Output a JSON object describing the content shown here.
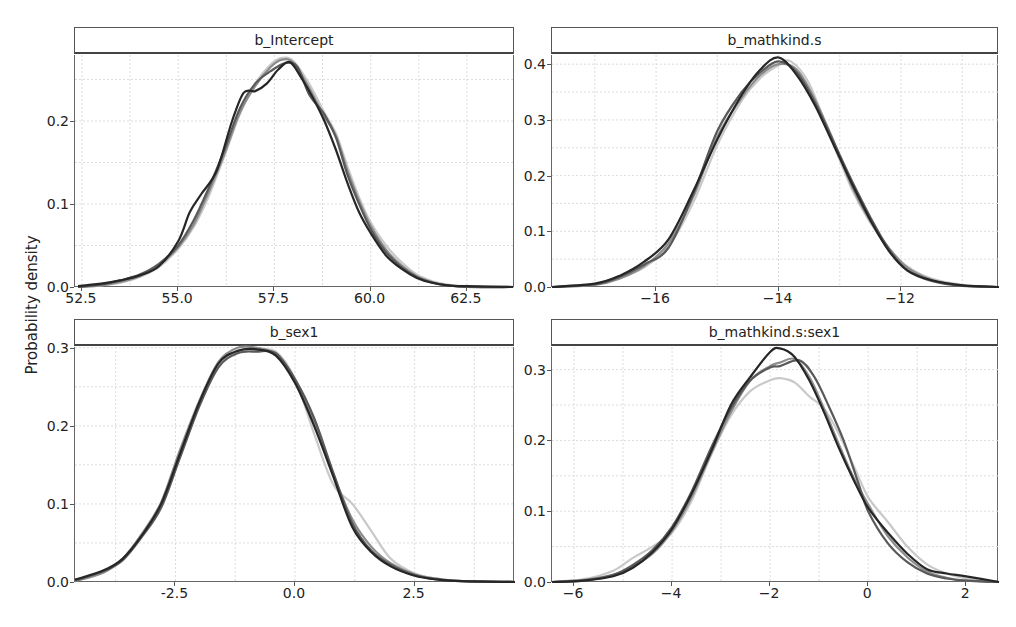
{
  "chart_data": {
    "type": "line",
    "title": "",
    "ylabel": "Probability density",
    "chain_colors": [
      "#262626",
      "#595959",
      "#8c8c8c",
      "#c9c9c9"
    ],
    "panels": [
      {
        "title": "b_Intercept",
        "box": {
          "left": 74,
          "top": 27,
          "width": 440,
          "height": 260
        },
        "xlim": [
          52.32,
          63.75
        ],
        "ylim": [
          0,
          0.2795
        ],
        "xticks": [
          52.5,
          55.0,
          57.5,
          60.0,
          62.5
        ],
        "xtick_labels": [
          "52.5",
          "55.0",
          "57.5",
          "60.0",
          "62.5"
        ],
        "yticks": [
          0.0,
          0.1,
          0.2
        ],
        "ytick_labels": [
          "0.0",
          "0.1",
          "0.2"
        ],
        "series": [
          {
            "name": "chain 1",
            "x": [
              52.4,
              53.0,
              53.5,
              54.0,
              54.5,
              55.0,
              55.3,
              55.6,
              56.0,
              56.4,
              56.7,
              57.0,
              57.3,
              57.6,
              57.9,
              58.2,
              58.5,
              58.8,
              59.1,
              59.4,
              59.7,
              60.0,
              60.4,
              60.8,
              61.2,
              61.6,
              62.0,
              62.5,
              63.7
            ],
            "y": [
              0.001,
              0.004,
              0.008,
              0.014,
              0.025,
              0.055,
              0.09,
              0.112,
              0.14,
              0.2,
              0.234,
              0.236,
              0.245,
              0.262,
              0.271,
              0.252,
              0.228,
              0.2,
              0.165,
              0.125,
              0.09,
              0.065,
              0.038,
              0.022,
              0.011,
              0.005,
              0.002,
              0.001,
              0.0
            ]
          },
          {
            "name": "chain 2",
            "x": [
              52.4,
              53.0,
              53.5,
              54.0,
              54.5,
              55.0,
              55.4,
              55.8,
              56.2,
              56.6,
              57.0,
              57.4,
              57.8,
              58.1,
              58.4,
              58.8,
              59.1,
              59.4,
              59.7,
              60.0,
              60.4,
              60.8,
              61.2,
              61.6,
              62.0,
              62.5,
              63.7
            ],
            "y": [
              0.0,
              0.003,
              0.008,
              0.015,
              0.028,
              0.05,
              0.08,
              0.12,
              0.165,
              0.215,
              0.245,
              0.26,
              0.27,
              0.265,
              0.232,
              0.208,
              0.18,
              0.135,
              0.1,
              0.07,
              0.042,
              0.024,
              0.012,
              0.005,
              0.002,
              0.0,
              0.0
            ]
          },
          {
            "name": "chain 3",
            "x": [
              52.4,
              53.0,
              53.5,
              54.0,
              54.5,
              55.0,
              55.4,
              55.8,
              56.2,
              56.6,
              57.0,
              57.4,
              57.7,
              58.0,
              58.4,
              58.8,
              59.1,
              59.4,
              59.7,
              60.0,
              60.4,
              60.8,
              61.2,
              61.6,
              62.0,
              62.5,
              63.7
            ],
            "y": [
              0.0,
              0.002,
              0.006,
              0.013,
              0.026,
              0.048,
              0.075,
              0.115,
              0.16,
              0.21,
              0.242,
              0.265,
              0.274,
              0.27,
              0.24,
              0.205,
              0.182,
              0.14,
              0.104,
              0.074,
              0.045,
              0.026,
              0.013,
              0.006,
              0.002,
              0.0,
              0.0
            ]
          },
          {
            "name": "chain 4",
            "x": [
              52.4,
              53.0,
              53.5,
              54.0,
              54.5,
              55.0,
              55.4,
              55.8,
              56.2,
              56.6,
              57.0,
              57.4,
              57.7,
              58.0,
              58.4,
              58.8,
              59.1,
              59.4,
              59.7,
              60.0,
              60.4,
              60.8,
              61.2,
              61.6,
              62.0,
              62.5,
              63.7
            ],
            "y": [
              0.0,
              0.002,
              0.005,
              0.012,
              0.024,
              0.046,
              0.072,
              0.11,
              0.158,
              0.208,
              0.245,
              0.268,
              0.276,
              0.272,
              0.245,
              0.21,
              0.185,
              0.145,
              0.108,
              0.078,
              0.05,
              0.03,
              0.015,
              0.007,
              0.003,
              0.001,
              0.0
            ]
          }
        ]
      },
      {
        "title": "b_mathkind.s",
        "box": {
          "left": 551,
          "top": 27,
          "width": 447,
          "height": 260
        },
        "xlim": [
          -17.7,
          -10.4
        ],
        "ylim": [
          0,
          0.4165
        ],
        "xticks": [
          -16,
          -14,
          -12
        ],
        "xtick_labels": [
          "−16",
          "−14",
          "−12"
        ],
        "yticks": [
          0.0,
          0.1,
          0.2,
          0.3,
          0.4
        ],
        "ytick_labels": [
          "0.0",
          "0.1",
          "0.2",
          "0.3",
          "0.4"
        ],
        "series": [
          {
            "name": "chain 1",
            "x": [
              -17.7,
              -17.0,
              -16.6,
              -16.2,
              -15.8,
              -15.4,
              -15.0,
              -14.6,
              -14.3,
              -14.0,
              -13.7,
              -13.4,
              -13.1,
              -12.8,
              -12.5,
              -12.2,
              -11.9,
              -11.5,
              -11.0,
              -10.4
            ],
            "y": [
              0.0,
              0.006,
              0.02,
              0.045,
              0.085,
              0.17,
              0.265,
              0.345,
              0.39,
              0.412,
              0.38,
              0.325,
              0.255,
              0.185,
              0.12,
              0.065,
              0.03,
              0.012,
              0.003,
              0.0
            ]
          },
          {
            "name": "chain 2",
            "x": [
              -17.7,
              -17.0,
              -16.6,
              -16.2,
              -15.8,
              -15.4,
              -15.0,
              -14.6,
              -14.3,
              -14.0,
              -13.7,
              -13.4,
              -13.1,
              -12.8,
              -12.5,
              -12.2,
              -11.9,
              -11.5,
              -11.0,
              -10.4
            ],
            "y": [
              0.0,
              0.005,
              0.018,
              0.04,
              0.07,
              0.165,
              0.28,
              0.35,
              0.385,
              0.405,
              0.385,
              0.33,
              0.26,
              0.19,
              0.125,
              0.068,
              0.03,
              0.011,
              0.002,
              0.0
            ]
          },
          {
            "name": "chain 3",
            "x": [
              -17.7,
              -17.0,
              -16.6,
              -16.2,
              -15.8,
              -15.4,
              -15.0,
              -14.6,
              -14.3,
              -14.0,
              -13.7,
              -13.4,
              -13.1,
              -12.8,
              -12.5,
              -12.2,
              -11.9,
              -11.5,
              -11.0,
              -10.4
            ],
            "y": [
              0.0,
              0.004,
              0.015,
              0.037,
              0.078,
              0.16,
              0.27,
              0.34,
              0.38,
              0.4,
              0.39,
              0.335,
              0.262,
              0.18,
              0.118,
              0.07,
              0.035,
              0.013,
              0.003,
              0.0
            ]
          },
          {
            "name": "chain 4",
            "x": [
              -17.7,
              -17.0,
              -16.6,
              -16.2,
              -15.8,
              -15.4,
              -15.0,
              -14.6,
              -14.3,
              -14.0,
              -13.8,
              -13.5,
              -13.1,
              -12.8,
              -12.5,
              -12.2,
              -11.9,
              -11.5,
              -11.0,
              -10.4
            ],
            "y": [
              0.0,
              0.005,
              0.016,
              0.035,
              0.072,
              0.15,
              0.255,
              0.335,
              0.375,
              0.398,
              0.405,
              0.365,
              0.255,
              0.175,
              0.115,
              0.07,
              0.037,
              0.015,
              0.004,
              0.0
            ]
          }
        ]
      },
      {
        "title": "b_sex1",
        "box": {
          "left": 74,
          "top": 319,
          "width": 440,
          "height": 263
        },
        "xlim": [
          -4.6,
          4.6
        ],
        "ylim": [
          0,
          0.301
        ],
        "xticks": [
          -2.5,
          0.0,
          2.5
        ],
        "xtick_labels": [
          "-2.5",
          "0.0",
          "2.5"
        ],
        "yticks": [
          0.0,
          0.1,
          0.2,
          0.3
        ],
        "ytick_labels": [
          "0.0",
          "0.1",
          "0.2",
          "0.3"
        ],
        "series": [
          {
            "name": "chain 1",
            "x": [
              -4.6,
              -4.0,
              -3.6,
              -3.2,
              -2.8,
              -2.4,
              -2.0,
              -1.6,
              -1.2,
              -0.8,
              -0.4,
              0.0,
              0.4,
              0.8,
              1.2,
              1.6,
              2.0,
              2.5,
              3.0,
              3.5,
              4.6
            ],
            "y": [
              0.003,
              0.015,
              0.03,
              0.06,
              0.1,
              0.165,
              0.23,
              0.28,
              0.296,
              0.298,
              0.29,
              0.255,
              0.2,
              0.135,
              0.07,
              0.038,
              0.02,
              0.008,
              0.003,
              0.001,
              0.0
            ]
          },
          {
            "name": "chain 2",
            "x": [
              -4.6,
              -4.0,
              -3.6,
              -3.2,
              -2.8,
              -2.4,
              -2.0,
              -1.6,
              -1.2,
              -0.8,
              -0.4,
              0.0,
              0.4,
              0.8,
              1.2,
              1.6,
              2.0,
              2.5,
              3.0,
              3.5,
              4.6
            ],
            "y": [
              0.002,
              0.014,
              0.028,
              0.058,
              0.095,
              0.16,
              0.225,
              0.275,
              0.293,
              0.295,
              0.293,
              0.26,
              0.21,
              0.14,
              0.075,
              0.04,
              0.022,
              0.009,
              0.003,
              0.001,
              0.0
            ]
          },
          {
            "name": "chain 3",
            "x": [
              -4.6,
              -4.0,
              -3.6,
              -3.2,
              -2.8,
              -2.4,
              -2.0,
              -1.6,
              -1.2,
              -0.8,
              -0.4,
              0.0,
              0.4,
              0.8,
              1.2,
              1.6,
              2.0,
              2.5,
              3.0,
              3.5,
              4.6
            ],
            "y": [
              0.001,
              0.012,
              0.03,
              0.062,
              0.102,
              0.17,
              0.232,
              0.282,
              0.3,
              0.3,
              0.292,
              0.258,
              0.205,
              0.138,
              0.08,
              0.045,
              0.024,
              0.01,
              0.004,
              0.001,
              0.0
            ]
          },
          {
            "name": "chain 4",
            "x": [
              -4.6,
              -4.0,
              -3.6,
              -3.2,
              -2.8,
              -2.4,
              -2.0,
              -1.6,
              -1.2,
              -0.8,
              -0.4,
              0.0,
              0.4,
              0.8,
              1.2,
              1.6,
              2.0,
              2.5,
              3.0,
              3.5,
              4.6
            ],
            "y": [
              0.002,
              0.013,
              0.03,
              0.06,
              0.098,
              0.162,
              0.228,
              0.278,
              0.296,
              0.297,
              0.295,
              0.26,
              0.19,
              0.125,
              0.1,
              0.065,
              0.03,
              0.011,
              0.004,
              0.001,
              0.0
            ]
          }
        ]
      },
      {
        "title": "b_mathkind.s:sex1",
        "box": {
          "left": 551,
          "top": 319,
          "width": 447,
          "height": 263
        },
        "xlim": [
          -6.45,
          2.67
        ],
        "ylim": [
          0,
          0.332
        ],
        "xticks": [
          -6,
          -4,
          -2,
          0,
          2
        ],
        "xtick_labels": [
          "−6",
          "−4",
          "−2",
          "0",
          "2"
        ],
        "yticks": [
          0.0,
          0.1,
          0.2,
          0.3
        ],
        "ytick_labels": [
          "0.0",
          "0.1",
          "0.2",
          "0.3"
        ],
        "series": [
          {
            "name": "chain 1",
            "x": [
              -6.45,
              -5.8,
              -5.2,
              -4.8,
              -4.4,
              -4.0,
              -3.6,
              -3.2,
              -2.8,
              -2.4,
              -2.0,
              -1.8,
              -1.5,
              -1.2,
              -0.9,
              -0.6,
              -0.3,
              0.0,
              0.4,
              0.8,
              1.2,
              1.6,
              2.0,
              2.67
            ],
            "y": [
              0.0,
              0.002,
              0.008,
              0.02,
              0.042,
              0.075,
              0.125,
              0.185,
              0.25,
              0.29,
              0.325,
              0.33,
              0.318,
              0.285,
              0.24,
              0.19,
              0.145,
              0.105,
              0.07,
              0.04,
              0.018,
              0.012,
              0.008,
              0.0
            ]
          },
          {
            "name": "chain 2",
            "x": [
              -6.45,
              -5.8,
              -5.2,
              -4.8,
              -4.4,
              -4.0,
              -3.6,
              -3.2,
              -2.8,
              -2.4,
              -2.0,
              -1.8,
              -1.4,
              -1.1,
              -0.8,
              -0.5,
              -0.2,
              0.0,
              0.4,
              0.8,
              1.2,
              1.6,
              2.0,
              2.67
            ],
            "y": [
              0.0,
              0.002,
              0.01,
              0.024,
              0.045,
              0.078,
              0.128,
              0.19,
              0.245,
              0.285,
              0.303,
              0.305,
              0.313,
              0.29,
              0.248,
              0.2,
              0.14,
              0.1,
              0.055,
              0.028,
              0.012,
              0.005,
              0.002,
              0.0
            ]
          },
          {
            "name": "chain 3",
            "x": [
              -6.45,
              -5.8,
              -5.2,
              -4.8,
              -4.4,
              -4.0,
              -3.6,
              -3.2,
              -2.8,
              -2.4,
              -2.0,
              -1.8,
              -1.5,
              -1.2,
              -0.9,
              -0.6,
              -0.3,
              0.0,
              0.4,
              0.8,
              1.2,
              1.6,
              2.0,
              2.67
            ],
            "y": [
              0.0,
              0.003,
              0.01,
              0.022,
              0.04,
              0.072,
              0.12,
              0.182,
              0.24,
              0.285,
              0.305,
              0.31,
              0.315,
              0.29,
              0.245,
              0.195,
              0.148,
              0.11,
              0.065,
              0.035,
              0.015,
              0.006,
              0.002,
              0.0
            ]
          },
          {
            "name": "chain 4",
            "x": [
              -6.45,
              -5.8,
              -5.2,
              -4.8,
              -4.4,
              -4.0,
              -3.6,
              -3.2,
              -2.8,
              -2.4,
              -2.0,
              -1.8,
              -1.5,
              -1.2,
              -0.9,
              -0.6,
              -0.3,
              0.0,
              0.4,
              0.8,
              1.2,
              1.6,
              2.0,
              2.67
            ],
            "y": [
              0.0,
              0.004,
              0.016,
              0.034,
              0.05,
              0.07,
              0.115,
              0.18,
              0.235,
              0.27,
              0.285,
              0.288,
              0.282,
              0.262,
              0.245,
              0.21,
              0.165,
              0.12,
              0.085,
              0.05,
              0.025,
              0.012,
              0.005,
              0.0
            ]
          }
        ]
      }
    ]
  }
}
